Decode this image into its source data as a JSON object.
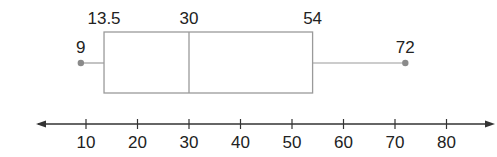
{
  "chart_data": {
    "type": "boxplot",
    "title": "",
    "xlabel": "",
    "ylabel": "",
    "five_number_summary": {
      "min": 9,
      "q1": 13.5,
      "median": 30,
      "q3": 54,
      "max": 72
    },
    "labels": {
      "min": "9",
      "q1": "13.5",
      "median": "30",
      "q3": "54",
      "max": "72"
    },
    "axis": {
      "ticks": [
        10,
        20,
        30,
        40,
        50,
        60,
        70,
        80
      ],
      "tick_labels": [
        "10",
        "20",
        "30",
        "40",
        "50",
        "60",
        "70",
        "80"
      ],
      "arrows": "both",
      "grid": false
    },
    "colors": {
      "box_stroke": "#9a9a9a",
      "point": "#8a8a8a",
      "axis": "#333333",
      "text": "#222222"
    }
  }
}
